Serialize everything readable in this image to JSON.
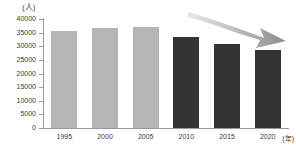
{
  "chart_data": {
    "type": "bar",
    "title": "",
    "subtitle": "",
    "xlabel": "(年)",
    "ylabel": "(人)",
    "categories": [
      "1995",
      "2000",
      "2005",
      "2010",
      "2015",
      "2020"
    ],
    "values": [
      35500,
      36800,
      37000,
      33500,
      31000,
      28500
    ],
    "series": [
      {
        "name": "人数",
        "values": [
          35500,
          36800,
          37000,
          33500,
          31000,
          28500
        ],
        "colors": [
          "#b5b5b5",
          "#b5b5b5",
          "#b5b5b5",
          "#333333",
          "#333333",
          "#333333"
        ]
      }
    ],
    "ylim": [
      0,
      40000
    ],
    "ytick_step": 5000,
    "ytick_labels": [
      "40000",
      "35000",
      "30000",
      "25000",
      "20000",
      "15000",
      "10000",
      "5000",
      "0"
    ],
    "ytick_values": [
      40000,
      35000,
      30000,
      25000,
      20000,
      15000,
      10000,
      5000,
      0
    ],
    "grid": false,
    "legend": "none",
    "annotations": [
      {
        "name": "downward-trend-arrow",
        "type": "arrow",
        "direction": "down-right",
        "color": "#a8a8a8"
      }
    ]
  },
  "axis": {
    "unit_label": "(人)",
    "x_axis_unit": "(年)"
  },
  "colors": {
    "bar_light": "#b5b5b5",
    "bar_dark": "#333333",
    "axis": "#9a9a9a",
    "text": "#3a3a3a",
    "arrow": "#a8a8a8",
    "background": "#ffffff"
  }
}
